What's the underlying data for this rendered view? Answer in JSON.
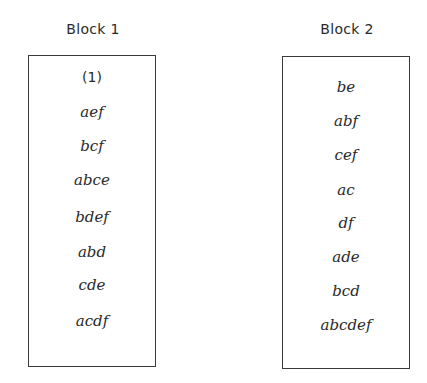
{
  "blocks": [
    {
      "label": "Block 1",
      "treatments": [
        "(1)",
        "aef",
        "bcf",
        "abce",
        "bdef",
        "abd",
        "cde",
        "acdf"
      ]
    },
    {
      "label": "Block 2",
      "treatments": [
        "be",
        "abf",
        "cef",
        "ac",
        "df",
        "ade",
        "bcd",
        "abcdef"
      ]
    }
  ],
  "colors": {
    "text": "#2a2a2a",
    "border": "#3a3a3a",
    "background": "#ffffff"
  }
}
